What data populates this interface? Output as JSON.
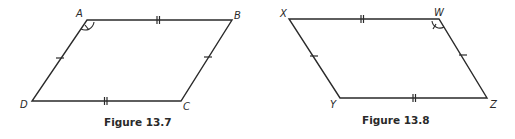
{
  "figures": [
    {
      "caption": "Figure 13.7",
      "shape": "parallelogram",
      "vertices": {
        "A": {
          "label": "A",
          "x": 87,
          "y": 20
        },
        "B": {
          "label": "B",
          "x": 232,
          "y": 20
        },
        "C": {
          "label": "C",
          "x": 181,
          "y": 101
        },
        "D": {
          "label": "D",
          "x": 32,
          "y": 101
        }
      },
      "marked_angle": "A",
      "congruence_marks": {
        "AB": "double-tick",
        "DC": "double-tick",
        "AD": "single-tick",
        "BC": "single-tick"
      }
    },
    {
      "caption": "Figure 13.8",
      "shape": "parallelogram",
      "vertices": {
        "X": {
          "label": "X",
          "x": 289,
          "y": 19
        },
        "W": {
          "label": "W",
          "x": 439,
          "y": 19
        },
        "Z": {
          "label": "Z",
          "x": 487,
          "y": 98
        },
        "Y": {
          "label": "Y",
          "x": 340,
          "y": 98
        }
      },
      "marked_angle": "W",
      "congruence_marks": {
        "XW": "double-tick",
        "YZ": "double-tick",
        "XY": "single-tick",
        "WZ": "single-tick"
      }
    }
  ],
  "colors": {
    "line": "#2a2a2a",
    "background": "#ffffff"
  }
}
